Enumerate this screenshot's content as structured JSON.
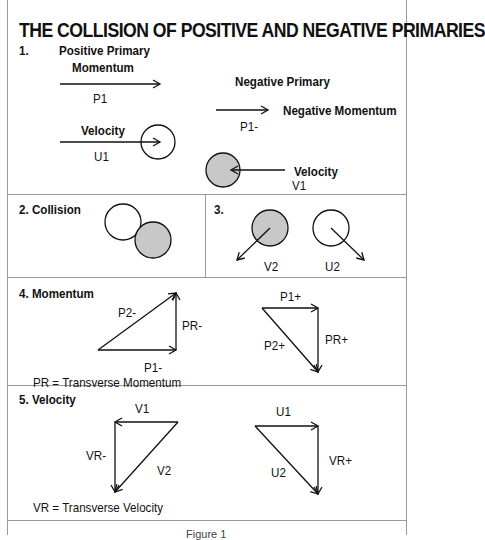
{
  "title": "THE COLLISION OF POSITIVE AND NEGATIVE PRIMARIES",
  "section1": {
    "number": "1.",
    "positive_primary": "Positive Primary",
    "momentum": "Momentum",
    "p1": "P1",
    "velocity": "Velocity",
    "u1": "U1",
    "negative_primary": "Negative Primary",
    "negative_momentum": "Negative Momentum",
    "p1_minus": "P1-",
    "neg_velocity": "Velocity",
    "v1": "V1"
  },
  "section2": {
    "label": "2. Collision"
  },
  "section3": {
    "label": "3.",
    "v2": "V2",
    "u2": "U2"
  },
  "section4": {
    "label": "4. Momentum",
    "p2_minus": "P2-",
    "pr_minus": "PR-",
    "p1_minus": "P1-",
    "p1_plus": "P1+",
    "p2_plus": "P2+",
    "pr_plus": "PR+",
    "legend": "PR = Transverse Momentum"
  },
  "section5": {
    "label": "5. Velocity",
    "v1": "V1",
    "vr_minus": "VR-",
    "v2": "V2",
    "u1": "U1",
    "u2": "U2",
    "vr_plus": "VR+",
    "legend": "VR = Transverse Velocity"
  },
  "caption": "Figure 1",
  "colors": {
    "shaded_circle": "#c8c8c8",
    "border": "#9a9a9a",
    "ink": "#111111"
  }
}
